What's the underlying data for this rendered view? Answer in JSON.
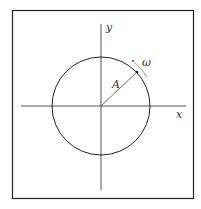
{
  "diagram": {
    "axes": {
      "x_label": "x",
      "y_label": "y"
    },
    "radius_label": "A",
    "angular_velocity_label": "ω",
    "stroke_color": "#222222"
  }
}
